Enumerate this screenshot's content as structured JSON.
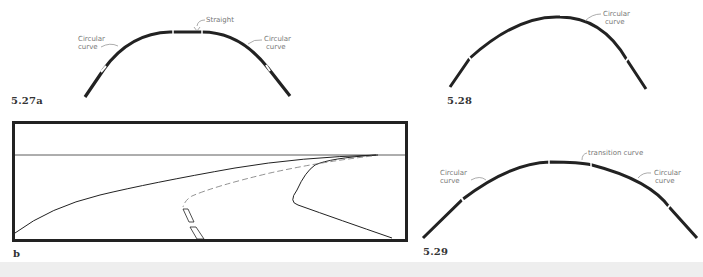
{
  "figures": {
    "fig_5_27a": {
      "label": "5.27a",
      "annotations": {
        "straight": "Straight",
        "left_curve_line1": "Circular",
        "left_curve_line2": "curve",
        "right_curve_line1": "Circular",
        "right_curve_line2": "curve"
      }
    },
    "fig_5_27b": {
      "label": "b"
    },
    "fig_5_28": {
      "label": "5.28",
      "annotations": {
        "curve_line1": "Circular",
        "curve_line2": "curve"
      }
    },
    "fig_5_29": {
      "label": "5.29",
      "annotations": {
        "transition": "transition curve",
        "left_curve_line1": "Circular",
        "left_curve_line2": "curve",
        "right_curve_line1": "Circular",
        "right_curve_line2": "curve"
      }
    }
  },
  "colors": {
    "stroke": "#222222",
    "annotation": "#777777",
    "background": "#ffffff",
    "bottom_band": "#eeeeee"
  }
}
